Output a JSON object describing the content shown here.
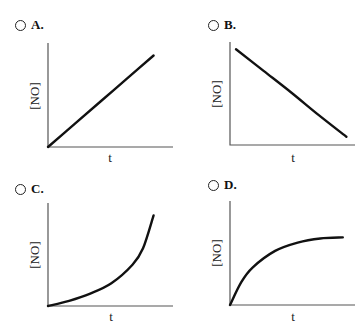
{
  "question": {
    "options": [
      {
        "id": "A",
        "label": "A.",
        "selected": false,
        "graph": {
          "type": "line",
          "shape": "linear-increasing",
          "ylabel": "[NO]",
          "xlabel": "t"
        }
      },
      {
        "id": "B",
        "label": "B.",
        "selected": false,
        "graph": {
          "type": "line",
          "shape": "linear-decreasing",
          "ylabel": "[NO]",
          "xlabel": "t"
        }
      },
      {
        "id": "C",
        "label": "C.",
        "selected": false,
        "graph": {
          "type": "line",
          "shape": "exponential-increasing",
          "ylabel": "[NO]",
          "xlabel": "t"
        }
      },
      {
        "id": "D",
        "label": "D.",
        "selected": false,
        "graph": {
          "type": "line",
          "shape": "saturating-increasing",
          "ylabel": "[NO]",
          "xlabel": "t"
        }
      }
    ]
  },
  "chart_data": [
    {
      "type": "line",
      "title": "A.",
      "xlabel": "t",
      "ylabel": "[NO]",
      "x": [
        0,
        0.25,
        0.5,
        0.75,
        1
      ],
      "y": [
        0,
        0.22,
        0.44,
        0.66,
        0.88
      ]
    },
    {
      "type": "line",
      "title": "B.",
      "xlabel": "t",
      "ylabel": "[NO]",
      "x": [
        0,
        0.25,
        0.5,
        0.75,
        1
      ],
      "y": [
        0.93,
        0.72,
        0.51,
        0.29,
        0.08
      ]
    },
    {
      "type": "line",
      "title": "C.",
      "xlabel": "t",
      "ylabel": "[NO]",
      "x": [
        0,
        0.2,
        0.4,
        0.6,
        0.8,
        0.9,
        1
      ],
      "y": [
        0,
        0.05,
        0.12,
        0.22,
        0.4,
        0.56,
        0.88
      ]
    },
    {
      "type": "line",
      "title": "D.",
      "xlabel": "t",
      "ylabel": "[NO]",
      "x": [
        0,
        0.1,
        0.2,
        0.4,
        0.6,
        0.8,
        1
      ],
      "y": [
        0,
        0.22,
        0.36,
        0.52,
        0.6,
        0.64,
        0.65
      ]
    }
  ]
}
